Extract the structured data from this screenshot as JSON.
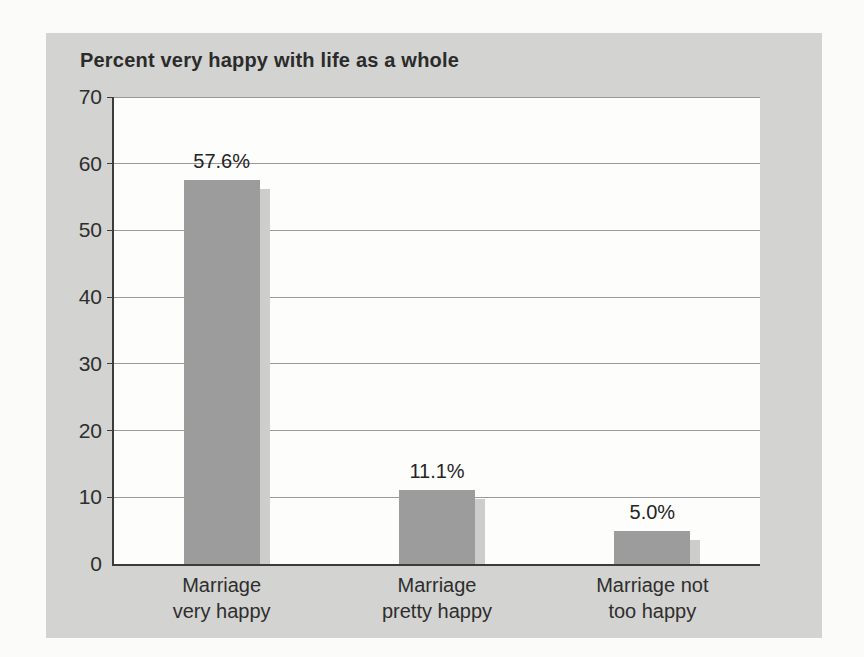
{
  "chart_data": {
    "type": "bar",
    "title": "Percent very happy with life as a whole",
    "categories": [
      {
        "line1": "Marriage",
        "line2": "very happy"
      },
      {
        "line1": "Marriage",
        "line2": "pretty happy"
      },
      {
        "line1": "Marriage not",
        "line2": "too happy"
      }
    ],
    "values": [
      57.6,
      11.1,
      5.0
    ],
    "value_labels": [
      "57.6%",
      "11.1%",
      "5.0%"
    ],
    "xlabel": "",
    "ylabel": "",
    "ylim": [
      0,
      70
    ],
    "yticks": [
      0,
      10,
      20,
      30,
      40,
      50,
      60,
      70
    ],
    "grid": true,
    "legend": "none",
    "colors": {
      "panel_background": "#d3d3d1",
      "plot_background": "#fdfdfc",
      "bar_fill": "#9c9c9c",
      "bar_shadow": "#cdcdcb",
      "gridline": "#9a9a9a",
      "axis_line": "#3c3c3c",
      "text": "#2b2b2b"
    }
  }
}
